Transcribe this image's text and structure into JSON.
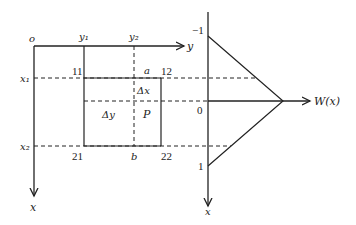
{
  "diagram": {
    "left_axes": {
      "origin": "o",
      "horizontal_axis": "y",
      "vertical_axis": "x",
      "y_marks": [
        "y₁",
        "y₂"
      ],
      "x_marks": [
        "x₁",
        "x₂"
      ]
    },
    "rectangle": {
      "corners": {
        "top_left": "11",
        "top_right": "12",
        "bottom_left": "21",
        "bottom_right": "22"
      },
      "point_a": "a",
      "point_b": "b",
      "delta_x": "Δx",
      "delta_y": "Δy",
      "point_p": "P"
    },
    "right_plot": {
      "vertical_axis": "x",
      "horizontal_axis": "W(x)",
      "tick_top": "−1",
      "tick_zero": "0",
      "tick_bottom": "1"
    }
  },
  "colors": {
    "line": "#222222",
    "background": "#ffffff"
  }
}
